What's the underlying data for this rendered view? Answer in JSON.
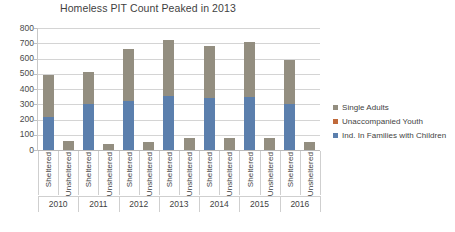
{
  "chart_data": {
    "type": "bar",
    "title": "Homeless PIT Count Peaked in 2013",
    "xlabel": "",
    "ylabel": "",
    "ylim": [
      0,
      800
    ],
    "yticks": [
      0,
      100,
      200,
      300,
      400,
      500,
      600,
      700,
      800
    ],
    "grid": true,
    "legend_position": "right",
    "stacked": true,
    "years": [
      "2010",
      "2011",
      "2012",
      "2013",
      "2014",
      "2015",
      "2016"
    ],
    "categories": [
      "Sheltered",
      "Unsheltered",
      "Sheltered",
      "Unsheltered",
      "Sheltered",
      "Unsheltered",
      "Sheltered",
      "Unsheltered",
      "Sheltered",
      "Unsheltered",
      "Sheltered",
      "Unsheltered",
      "Sheltered",
      "Unsheltered"
    ],
    "series": [
      {
        "name": "Ind. In Families with Children",
        "color": "#5b7fad",
        "values": [
          215,
          0,
          300,
          0,
          320,
          0,
          355,
          0,
          340,
          0,
          350,
          0,
          300,
          0
        ]
      },
      {
        "name": "Unaccompanied Youth",
        "color": "#c0693a",
        "values": [
          0,
          0,
          0,
          0,
          0,
          0,
          0,
          0,
          0,
          0,
          0,
          0,
          0,
          0
        ]
      },
      {
        "name": "Single Adults",
        "color": "#938e80",
        "values": [
          280,
          60,
          210,
          40,
          340,
          50,
          365,
          80,
          340,
          80,
          360,
          80,
          290,
          55
        ]
      }
    ],
    "totals": [
      495,
      60,
      510,
      40,
      660,
      50,
      720,
      80,
      680,
      80,
      710,
      80,
      590,
      55
    ]
  },
  "legend": {
    "items": [
      {
        "label": "Single Adults",
        "color": "#938e80"
      },
      {
        "label": "Unaccompanied Youth",
        "color": "#c0693a"
      },
      {
        "label": "Ind. In Families with Children",
        "color": "#5b7fad"
      }
    ]
  }
}
